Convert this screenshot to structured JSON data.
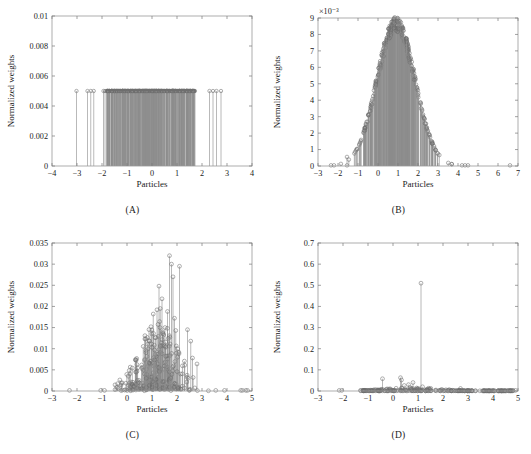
{
  "figure": {
    "type": "multi-panel-stem-plots",
    "panels": [
      "A",
      "B",
      "C",
      "D"
    ]
  },
  "panels": {
    "A": {
      "caption": "(A)",
      "xlabel": "Particles",
      "ylabel": "Normalized weights",
      "xticks": [
        "-4",
        "-3",
        "-2",
        "-1",
        "0",
        "1",
        "2",
        "3",
        "4"
      ],
      "yticks": [
        "0",
        "0.002",
        "0.004",
        "0.006",
        "0.008",
        "0.01"
      ],
      "multiplier": ""
    },
    "B": {
      "caption": "(B)",
      "xlabel": "Particles",
      "ylabel": "Normalized weights",
      "xticks": [
        "-3",
        "-2",
        "-1",
        "0",
        "1",
        "2",
        "3",
        "4",
        "5",
        "6",
        "7"
      ],
      "yticks": [
        "0",
        "1",
        "2",
        "3",
        "4",
        "5",
        "6",
        "7",
        "8",
        "9"
      ],
      "multiplier": "×10⁻³"
    },
    "C": {
      "caption": "(C)",
      "xlabel": "Particles",
      "ylabel": "Normalized weights",
      "xticks": [
        "-3",
        "-2",
        "-1",
        "0",
        "1",
        "2",
        "3",
        "4",
        "5"
      ],
      "yticks": [
        "0",
        "0.005",
        "0.01",
        "0.015",
        "0.02",
        "0.025",
        "0.03",
        "0.035"
      ],
      "multiplier": ""
    },
    "D": {
      "caption": "(D)",
      "xlabel": "Particles",
      "ylabel": "Normalized weights",
      "xticks": [
        "-3",
        "-2",
        "-1",
        "0",
        "1",
        "2",
        "3",
        "4",
        "5"
      ],
      "yticks": [
        "0",
        "0.1",
        "0.2",
        "0.3",
        "0.4",
        "0.5",
        "0.6",
        "0.7"
      ],
      "multiplier": ""
    }
  },
  "chart_data": [
    {
      "type": "scatter",
      "panel": "A",
      "title": "(A)",
      "xlabel": "Particles",
      "ylabel": "Normalized weights",
      "xlim": [
        -4,
        4
      ],
      "ylim": [
        0,
        0.01
      ],
      "xticks": [
        -4,
        -3,
        -2,
        -1,
        0,
        1,
        2,
        3,
        4
      ],
      "yticks": [
        0,
        0.002,
        0.004,
        0.006,
        0.008,
        0.01
      ],
      "grid": false,
      "legend": null,
      "note": "Uniform (resampled) weights: every particle has identical weight 0.005 = 1/200",
      "uniform_weight": 0.005,
      "n_particles": 200,
      "x": [
        -3.02,
        -2.58,
        -2.45,
        -2.33,
        -1.94,
        -1.88,
        -1.82,
        -1.77,
        -1.72,
        -1.68,
        -1.63,
        -1.58,
        -1.55,
        -1.5,
        -1.46,
        -1.42,
        -1.38,
        -1.34,
        -1.3,
        -1.26,
        -1.22,
        -1.18,
        -1.14,
        -1.1,
        -1.06,
        -1.02,
        -0.99,
        -0.95,
        -0.92,
        -0.88,
        -0.85,
        -0.82,
        -0.79,
        -0.76,
        -0.73,
        -0.7,
        -0.67,
        -0.64,
        -0.61,
        -0.58,
        -0.56,
        -0.53,
        -0.5,
        -0.48,
        -0.45,
        -0.43,
        -0.4,
        -0.38,
        -0.35,
        -0.33,
        -0.31,
        -0.28,
        -0.26,
        -0.24,
        -0.22,
        -0.2,
        -0.18,
        -0.16,
        -0.14,
        -0.12,
        -0.1,
        -0.08,
        -0.06,
        -0.04,
        -0.02,
        0.0,
        0.02,
        0.04,
        0.06,
        0.08,
        0.1,
        0.12,
        0.14,
        0.16,
        0.18,
        0.2,
        0.22,
        0.24,
        0.26,
        0.28,
        0.31,
        0.33,
        0.35,
        0.38,
        0.4,
        0.43,
        0.45,
        0.48,
        0.5,
        0.53,
        0.56,
        0.58,
        0.61,
        0.64,
        0.67,
        0.7,
        0.73,
        0.76,
        0.79,
        0.82,
        0.85,
        0.88,
        0.92,
        0.95,
        0.99,
        1.02,
        1.06,
        1.1,
        1.14,
        1.18,
        1.22,
        1.26,
        1.3,
        1.34,
        1.38,
        1.42,
        1.46,
        1.5,
        1.55,
        1.58,
        1.63,
        1.68,
        1.72,
        2.3,
        2.44,
        2.58,
        2.76
      ]
    },
    {
      "type": "scatter",
      "panel": "B",
      "title": "(B)",
      "xlabel": "Particles",
      "ylabel": "Normalized weights",
      "xlim": [
        -3,
        7
      ],
      "ylim": [
        0,
        0.009
      ],
      "y_multiplier": 0.001,
      "xticks": [
        -3,
        -2,
        -1,
        0,
        1,
        2,
        3,
        4,
        5,
        6,
        7
      ],
      "yticks": [
        0,
        1,
        2,
        3,
        4,
        5,
        6,
        7,
        8,
        9
      ],
      "grid": false,
      "legend": null,
      "note": "Approximately Gaussian weight envelope centred near x = 0.9, peak 8.8e-3",
      "peak_x": 0.9,
      "peak_y": 0.0088,
      "envelope": {
        "mean": 0.9,
        "sigma": 0.95,
        "peak": 0.0088
      },
      "outliers_x": [
        -2.35,
        -2.2,
        -1.55,
        4.2,
        4.35,
        4.5,
        6.6
      ]
    },
    {
      "type": "scatter",
      "panel": "C",
      "title": "(C)",
      "xlabel": "Particles",
      "ylabel": "Normalized weights",
      "xlim": [
        -3,
        5
      ],
      "ylim": [
        0,
        0.035
      ],
      "xticks": [
        -3,
        -2,
        -1,
        0,
        1,
        2,
        3,
        4,
        5
      ],
      "yticks": [
        0,
        0.005,
        0.01,
        0.015,
        0.02,
        0.025,
        0.03,
        0.035
      ],
      "grid": false,
      "legend": null,
      "note": "Degenerating weights: scattered spikes, maximum 0.032 near x = 1.7",
      "max_weight": 0.032,
      "max_x": 1.7,
      "notable_points": [
        {
          "x": 1.7,
          "y": 0.032
        },
        {
          "x": 1.78,
          "y": 0.03
        },
        {
          "x": 2.1,
          "y": 0.0295
        },
        {
          "x": 1.84,
          "y": 0.027
        },
        {
          "x": 1.28,
          "y": 0.0248
        },
        {
          "x": 1.4,
          "y": 0.0218
        },
        {
          "x": 1.33,
          "y": 0.0195
        },
        {
          "x": 1.2,
          "y": 0.0192
        },
        {
          "x": 1.62,
          "y": 0.0188
        },
        {
          "x": 1.05,
          "y": 0.0182
        },
        {
          "x": 1.9,
          "y": 0.0172
        },
        {
          "x": 2.42,
          "y": 0.0145
        },
        {
          "x": 0.96,
          "y": 0.0152
        },
        {
          "x": 1.52,
          "y": 0.015
        },
        {
          "x": 1.95,
          "y": 0.0143
        },
        {
          "x": 2.55,
          "y": 0.0118
        },
        {
          "x": 2.62,
          "y": 0.0078
        },
        {
          "x": 2.8,
          "y": 0.0064
        }
      ]
    },
    {
      "type": "scatter",
      "panel": "D",
      "title": "(D)",
      "xlabel": "Particles",
      "ylabel": "Normalized weights",
      "xlim": [
        -3,
        5
      ],
      "ylim": [
        0,
        0.7
      ],
      "xticks": [
        -3,
        -2,
        -1,
        0,
        1,
        2,
        3,
        4,
        5
      ],
      "yticks": [
        0,
        0.1,
        0.2,
        0.3,
        0.4,
        0.5,
        0.6,
        0.7
      ],
      "grid": false,
      "legend": null,
      "note": "Fully degenerate weights: single dominant particle of weight 0.51 at x = 1.12",
      "max_weight": 0.51,
      "max_x": 1.12,
      "notable_points": [
        {
          "x": 1.12,
          "y": 0.51
        },
        {
          "x": 0.3,
          "y": 0.063
        },
        {
          "x": -0.42,
          "y": 0.058
        },
        {
          "x": 0.34,
          "y": 0.052
        },
        {
          "x": 0.8,
          "y": 0.04
        },
        {
          "x": 0.62,
          "y": 0.03
        },
        {
          "x": 0.45,
          "y": 0.026
        },
        {
          "x": 1.18,
          "y": 0.02
        },
        {
          "x": 2.7,
          "y": 0.012
        }
      ]
    }
  ]
}
